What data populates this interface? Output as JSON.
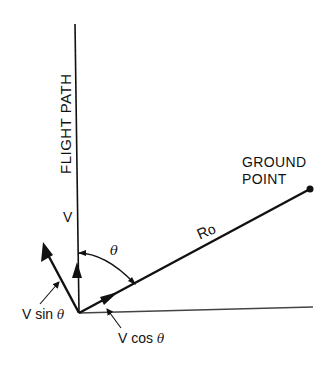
{
  "diagram": {
    "labels": {
      "flight_path": "FLIGHT PATH",
      "v": "V",
      "theta": "θ",
      "ro_main": "R",
      "ro_sub": "o",
      "ground_line1": "GROUND",
      "ground_line2": "POINT",
      "v_sin_prefix": "V sin ",
      "v_sin_theta": "θ",
      "v_cos_prefix": "V cos ",
      "v_cos_theta": "θ"
    },
    "colors": {
      "ink": "#111111",
      "background": "#ffffff",
      "ground_line": "#444444"
    }
  }
}
